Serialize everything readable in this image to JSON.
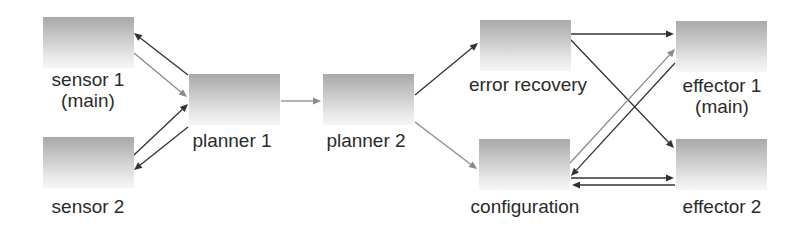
{
  "diagram": {
    "type": "flow",
    "nodes": [
      {
        "id": "sensor1",
        "label_lines": [
          "sensor 1",
          "(main)"
        ],
        "x": 43,
        "y": 17,
        "label_cx": 88,
        "label_y": 69
      },
      {
        "id": "sensor2",
        "label_lines": [
          "sensor 2"
        ],
        "x": 43,
        "y": 137,
        "label_cx": 88,
        "label_y": 196
      },
      {
        "id": "planner1",
        "label_lines": [
          "planner 1"
        ],
        "x": 189,
        "y": 74,
        "label_cx": 232,
        "label_y": 130
      },
      {
        "id": "planner2",
        "label_lines": [
          "planner 2"
        ],
        "x": 323,
        "y": 74,
        "label_cx": 366,
        "label_y": 130
      },
      {
        "id": "error_recovery",
        "label_lines": [
          "error recovery"
        ],
        "x": 480,
        "y": 20,
        "label_cx": 528,
        "label_y": 74
      },
      {
        "id": "configuration",
        "label_lines": [
          "configuration"
        ],
        "x": 479,
        "y": 139,
        "label_cx": 525,
        "label_y": 196
      },
      {
        "id": "effector1",
        "label_lines": [
          "effector 1",
          "(main)"
        ],
        "x": 676,
        "y": 21,
        "label_cx": 722,
        "label_y": 75
      },
      {
        "id": "effector2",
        "label_lines": [
          "effector 2"
        ],
        "x": 676,
        "y": 139,
        "label_cx": 722,
        "label_y": 196
      }
    ],
    "edges": [
      {
        "from": "planner1",
        "to": "sensor1",
        "x1": 188,
        "y1": 75,
        "x2": 134,
        "y2": 33,
        "color": "#333333"
      },
      {
        "from": "sensor1",
        "to": "planner1",
        "x1": 134,
        "y1": 53,
        "x2": 187,
        "y2": 97,
        "color": "#8a8a8a"
      },
      {
        "from": "sensor2",
        "to": "planner1",
        "x1": 134,
        "y1": 155,
        "x2": 188,
        "y2": 104,
        "color": "#333333"
      },
      {
        "from": "planner1",
        "to": "sensor2",
        "x1": 188,
        "y1": 127,
        "x2": 134,
        "y2": 170,
        "color": "#333333"
      },
      {
        "from": "planner1",
        "to": "planner2",
        "x1": 281,
        "y1": 101,
        "x2": 321,
        "y2": 101,
        "color": "#8a8a8a"
      },
      {
        "from": "planner2",
        "to": "error_recovery",
        "x1": 415,
        "y1": 95,
        "x2": 478,
        "y2": 43,
        "color": "#333333"
      },
      {
        "from": "planner2",
        "to": "configuration",
        "x1": 415,
        "y1": 122,
        "x2": 477,
        "y2": 169,
        "color": "#8a8a8a"
      },
      {
        "from": "error_recovery",
        "to": "effector1",
        "x1": 570,
        "y1": 34,
        "x2": 674,
        "y2": 34,
        "color": "#333333"
      },
      {
        "from": "error_recovery",
        "to": "effector2",
        "x1": 570,
        "y1": 39,
        "x2": 674,
        "y2": 148,
        "color": "#333333"
      },
      {
        "from": "configuration",
        "to": "effector1",
        "x1": 570,
        "y1": 163,
        "x2": 675,
        "y2": 49,
        "color": "#8a8a8a"
      },
      {
        "from": "effector1",
        "to": "configuration",
        "x1": 675,
        "y1": 63,
        "x2": 571,
        "y2": 176,
        "color": "#333333"
      },
      {
        "from": "configuration",
        "to": "effector2",
        "x1": 571,
        "y1": 178,
        "x2": 674,
        "y2": 178,
        "color": "#333333"
      },
      {
        "from": "effector2",
        "to": "configuration",
        "x1": 675,
        "y1": 185,
        "x2": 572,
        "y2": 185,
        "color": "#333333"
      }
    ]
  }
}
